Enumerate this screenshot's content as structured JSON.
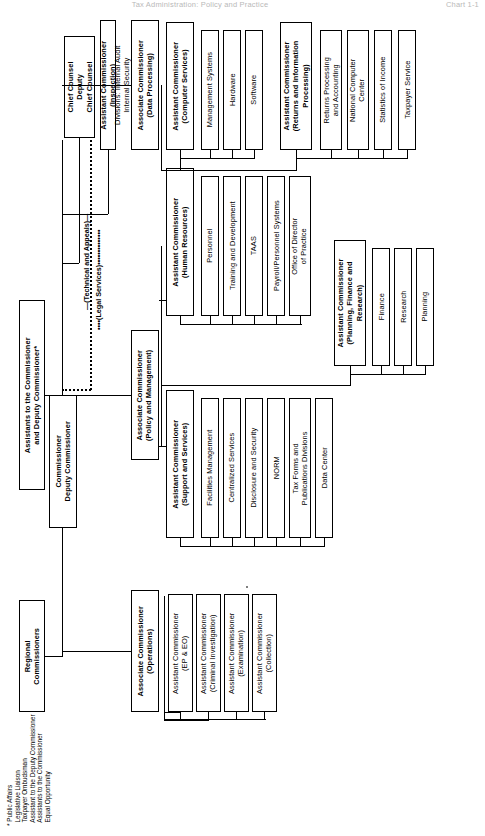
{
  "running_head": {
    "title": "Tax Administration: Policy and Practice",
    "folio": "Chart 1-1"
  },
  "chart": {
    "orientation": "landscape-rotated-90",
    "top_level": {
      "commissioner": "Commissioner\nDeputy Commissioner",
      "assistants": "Assistants to the Commissioner\nand Deputy Commissioner*",
      "regional": "Regional\nCommissioners",
      "chief_counsel": "Chief Counsel\nDeputy\nChief Counsel",
      "inspection": "Assistant Commissioner\n(Inspection)",
      "inspection_sub": "Divisions: Internal Audit\nInternal Security"
    },
    "link_labels": {
      "technical": "—(Technical and Appeals)—",
      "legal": "••••(Legal Services)••••••••••••••"
    },
    "groups": [
      {
        "id": "operations",
        "head": "Associate Commissioner\n(Operations)",
        "children": [
          "Assistant Commissioner\n(EP & EO)",
          "Assistant Commissioner\n(Criminal Investigation)",
          "Assistant Commissioner\n(Examination)",
          "Assistant Commissioner\n(Collection)"
        ]
      },
      {
        "id": "policy-management",
        "head": "Associate Commissioner\n(Policy and Management)",
        "children": []
      },
      {
        "id": "support-services",
        "head": "Assistant Commissioner\n(Support and Services)",
        "children": [
          "Facilities Management",
          "Centralized Services",
          "Disclosure and Security",
          "NORM",
          "Tax Forms and\nPublications Divisions",
          "Data Center"
        ]
      },
      {
        "id": "human-resources",
        "head": "Assistant Commissioner\n(Human Resources)",
        "children": [
          "Personnel",
          "Training and Development",
          "TAAS",
          "Payroll/Personnel Systems",
          "Office of Director\nof Practice"
        ]
      },
      {
        "id": "planning-finance-research",
        "head": "Assistant Commissioner\n(Planning, Finance and\nResearch)",
        "children": [
          "Finance",
          "Research",
          "Planning"
        ]
      },
      {
        "id": "data-processing",
        "head": "Associate  Commissioner\n(Data Processing)",
        "children": []
      },
      {
        "id": "computer-services",
        "head": "Assistant Commissioner\n(Computer Services)",
        "children": [
          "Management Systems",
          "Hardware",
          "Software"
        ]
      },
      {
        "id": "returns-information-processing",
        "head": "Assistant Commissioner\n(Returns and Information\nProcessing)",
        "children": [
          "Returns Processing\nand Accounting",
          "National Computer\nCenter",
          "Statistics of Income",
          "Taxpayer Service"
        ]
      }
    ],
    "footnote": "* Public Affairs\n  Legislative Liaison\n  Taxpayer Ombudsman\n  Assistant to the Deputy Commissioner\n  Assistants to the Commissioner\n  Equal Opportunity"
  }
}
